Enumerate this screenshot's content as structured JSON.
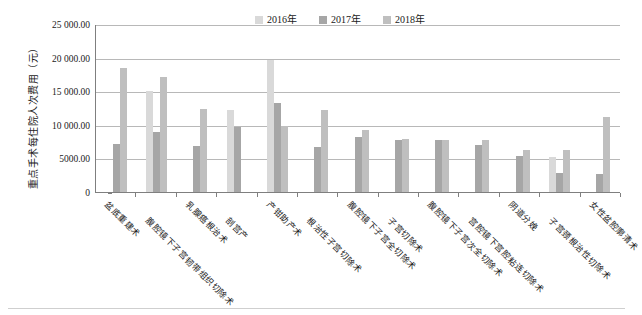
{
  "chart_data": {
    "type": "bar",
    "title": "",
    "xlabel": "",
    "ylabel": "重点手术每住院人次费用（元）",
    "ylim": [
      0,
      25000
    ],
    "ytick_labels": [
      "0",
      "5000.00",
      "10 000.00",
      "15 000.00",
      "20 000.00",
      "25 000.00"
    ],
    "ytick_values": [
      0,
      5000,
      10000,
      15000,
      20000,
      25000
    ],
    "grid": true,
    "legend_position": "top-center",
    "categories": [
      "盆底重建术",
      "腹腔镜下子宫韧带组织切除术",
      "乳腺癌根治术",
      "剖宫产",
      "产钳助产术",
      "根治性子宫切除术",
      "腹腔镜下子宫全切除术",
      "子宫切除术",
      "腹腔镜下子宫次全切除术",
      "宫腔镜下宫腔粘连切除术",
      "阴道分娩",
      "子宫颈根治性切除术",
      "女性盆腔廓清术"
    ],
    "series": [
      {
        "name": "2016年",
        "color": "#d9d9d9",
        "values": [
          0,
          15100,
          0,
          12200,
          19600,
          0,
          0,
          0,
          0,
          0,
          0,
          5200,
          0
        ]
      },
      {
        "name": "2017年",
        "color": "#a6a6a6",
        "values": [
          7200,
          9000,
          6900,
          9700,
          13200,
          6700,
          8200,
          7700,
          7800,
          7000,
          5400,
          2900,
          2700
        ]
      },
      {
        "name": "2018年",
        "color": "#bfbfbf",
        "values": [
          18400,
          17100,
          12300,
          0,
          9800,
          12200,
          9300,
          7900,
          7800,
          7700,
          6300,
          6300,
          11200
        ]
      }
    ]
  },
  "legend": {
    "items": [
      {
        "label": "2016年",
        "color": "#d9d9d9"
      },
      {
        "label": "2017年",
        "color": "#a6a6a6"
      },
      {
        "label": "2018年",
        "color": "#bfbfbf"
      }
    ]
  }
}
